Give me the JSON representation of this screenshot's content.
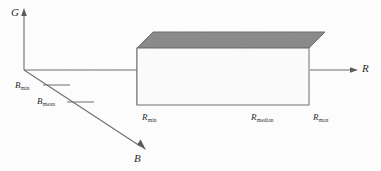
{
  "figure": {
    "type": "3d-axes-diagram",
    "background_color": "#fdfdfd",
    "line_color": "#6e6e6e",
    "text_color": "#2b2b2b"
  },
  "axes": {
    "g_axis": {
      "name": "G",
      "direction": "up",
      "arrow": true
    },
    "r_axis": {
      "name": "R",
      "direction": "right",
      "arrow": true
    },
    "b_axis": {
      "name": "B",
      "direction": "down-right",
      "arrow": true
    }
  },
  "ticks": {
    "b_axis": [
      {
        "base": "B",
        "sub": "min"
      },
      {
        "base": "B",
        "sub": "mean"
      }
    ],
    "r_axis": [
      {
        "base": "R",
        "sub": "min"
      },
      {
        "base": "R",
        "sub": "median"
      },
      {
        "base": "R",
        "sub": "max"
      }
    ]
  },
  "box": {
    "name": "cuboid-region",
    "top_face_color": "#8a8a8a",
    "front_face_color": "#fbfbfb",
    "side_face_color": "#f4f4f4",
    "edge_color": "#6e6e6e"
  }
}
